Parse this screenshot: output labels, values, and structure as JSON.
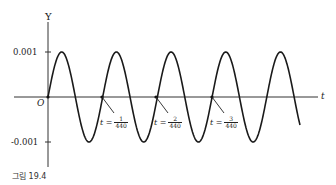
{
  "chart_data": {
    "type": "line",
    "title": "",
    "xlabel": "t",
    "ylabel": "Y",
    "function": "Y = 0.001 sin(880 pi t)",
    "amplitude": 0.001,
    "frequency_hz": 440,
    "yticks": [
      "0.001",
      "-0.001"
    ],
    "ylim": [
      -0.0013,
      0.0013
    ],
    "origin_label": "O",
    "annotations": [
      {
        "label": "t =",
        "num": "1",
        "den": "440",
        "t": 0.00227
      },
      {
        "label": "t =",
        "num": "2",
        "den": "440",
        "t": 0.00455
      },
      {
        "label": "t =",
        "num": "3",
        "den": "440",
        "t": 0.00682
      }
    ],
    "grid": false,
    "legend": null,
    "cycles_shown": 4.5
  },
  "axis": {
    "y_label": "Y",
    "x_label": "t",
    "origin": "O",
    "ytick_top": "0.001",
    "ytick_bottom": "-0.001"
  },
  "caption": "그림 19.4",
  "colors": {
    "curve": "#1a1a1a",
    "axis": "#333333",
    "background": "#ffffff"
  }
}
